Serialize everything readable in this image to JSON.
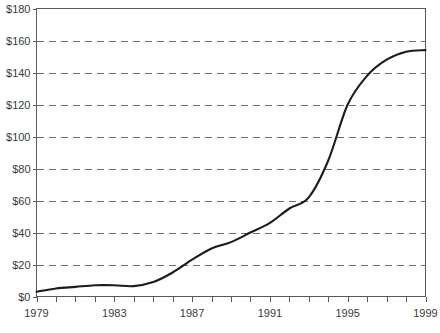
{
  "chart_data": {
    "type": "line",
    "title": "",
    "subtitle": "",
    "xlabel": "",
    "ylabel": "",
    "xlim": [
      1979,
      1999
    ],
    "ylim": [
      0,
      180
    ],
    "grid": true,
    "legend": null,
    "y_tick_labels": [
      "$180",
      "$160",
      "$140",
      "$120",
      "$100",
      "$80",
      "$60",
      "$40",
      "$20",
      "$0"
    ],
    "y_tick_values": [
      180,
      160,
      140,
      120,
      100,
      80,
      60,
      40,
      20,
      0
    ],
    "x_tick_labels": [
      "1979",
      "1983",
      "1987",
      "1991",
      "1995",
      "1999"
    ],
    "x_tick_values": [
      1979,
      1983,
      1987,
      1991,
      1995,
      1999
    ],
    "x_minor_ticks": [
      1979,
      1980,
      1981,
      1982,
      1983,
      1984,
      1985,
      1986,
      1987,
      1988,
      1989,
      1990,
      1991,
      1992,
      1993,
      1994,
      1995,
      1996,
      1997,
      1998,
      1999
    ],
    "x": [
      1979,
      1980,
      1981,
      1982,
      1983,
      1984,
      1985,
      1986,
      1987,
      1988,
      1989,
      1990,
      1991,
      1992,
      1993,
      1994,
      1995,
      1996,
      1997,
      1998,
      1999
    ],
    "values": [
      3,
      5,
      6,
      7,
      7,
      6.5,
      9,
      15,
      23,
      30,
      34,
      40,
      46,
      55,
      62,
      85,
      120,
      138,
      148,
      153,
      154
    ],
    "series": [
      {
        "name": "",
        "values": [
          3,
          5,
          6,
          7,
          7,
          6.5,
          9,
          15,
          23,
          30,
          34,
          40,
          46,
          55,
          62,
          85,
          120,
          138,
          148,
          153,
          154
        ]
      }
    ],
    "line_color": "#1c1c1c",
    "grid_color": "#6e6e6e",
    "axis_color": "#5a5a5a"
  }
}
